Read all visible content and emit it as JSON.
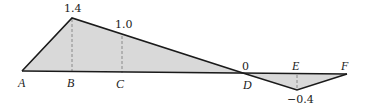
{
  "diagram": {
    "type": "influence-line",
    "fill_color": "#d9d9d9",
    "line_color": "#1a1a1a",
    "points": [
      {
        "name": "A",
        "value": "",
        "x": 22,
        "y_base": 71
      },
      {
        "name": "B",
        "value": "1.4",
        "x": 72,
        "y_base": 72,
        "y_val": 18
      },
      {
        "name": "C",
        "value": "1.0",
        "x": 122,
        "y_base": 73,
        "y_val": 35
      },
      {
        "name": "D",
        "value": "0",
        "x": 246,
        "y_base": 74
      },
      {
        "name": "E",
        "value": "-0.4",
        "x": 297,
        "y_base": 74,
        "y_val": 90
      },
      {
        "name": "F",
        "value": "",
        "x": 347,
        "y_base": 74
      }
    ],
    "labels": {
      "A": "A",
      "B": "B",
      "C": "C",
      "D": "D",
      "E": "E",
      "F": "F",
      "val_B": "1.4",
      "val_C": "1.0",
      "val_D": "0",
      "val_E": "−0.4"
    }
  }
}
